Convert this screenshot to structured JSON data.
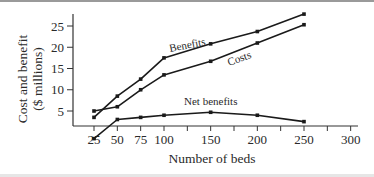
{
  "chart_data": {
    "type": "line",
    "title": "",
    "xlabel": "Number of beds",
    "ylabel": [
      "Cost and benefit",
      "($ millions)"
    ],
    "x_ticks": [
      25,
      50,
      75,
      100,
      150,
      200,
      250,
      300
    ],
    "x_tick_labels": [
      "25",
      "50",
      "75",
      "100",
      "150",
      "200",
      "250",
      "300"
    ],
    "minor_x_ticks": [
      125,
      175,
      225,
      275
    ],
    "y_ticks": [
      5,
      10,
      15,
      20,
      25
    ],
    "y_tick_labels": [
      "5",
      "10",
      "15",
      "20",
      "25"
    ],
    "xlim": [
      0,
      310
    ],
    "ylim": [
      0,
      28
    ],
    "grid": false,
    "legend": "inline-labels",
    "x": [
      25,
      50,
      75,
      100,
      150,
      200,
      250
    ],
    "series": [
      {
        "name": "Benefits",
        "values": [
          3.5,
          8.5,
          12.5,
          17.5,
          20.8,
          23.7,
          27.8
        ]
      },
      {
        "name": "Costs",
        "values": [
          5,
          6,
          10,
          13.5,
          16.7,
          21,
          25.3
        ]
      },
      {
        "name": "Net benefits",
        "values": [
          -1.5,
          3,
          3.5,
          4,
          4.7,
          4,
          2.5
        ]
      }
    ],
    "line_color": "#1a1a1a"
  }
}
